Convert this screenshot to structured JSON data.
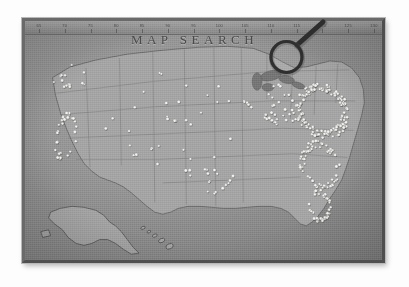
{
  "page": {
    "background_color": "#fdfdfd"
  },
  "map": {
    "title": "MAP SEARCH",
    "frame_color": "#6a6a6a",
    "paper_color": "#9a9a9a",
    "land_color": "#a2a2a2",
    "pin_color": "#f2f2ef",
    "subject": "united-states-map",
    "ruler_ticks": [
      "65",
      "70",
      "75",
      "80",
      "85",
      "90",
      "95",
      "100",
      "105",
      "110",
      "115",
      "120",
      "125",
      "130"
    ]
  },
  "magnifier": {
    "label": "magnifying-glass",
    "lens_color": "#3a3a3a",
    "handle_color": "#2e2e2e"
  },
  "insets": [
    {
      "name": "alaska"
    },
    {
      "name": "hawaii"
    }
  ],
  "chart_data": {
    "type": "scatter",
    "title": "MAP SEARCH",
    "xlabel": "",
    "ylabel": "",
    "legend_position": "none",
    "grid": false,
    "regions": [
      {
        "name": "northeast-atlantic-corridor",
        "pin_count": 420,
        "density": "very-high"
      },
      {
        "name": "southeast-atlantic-coast",
        "pin_count": 180,
        "density": "high"
      },
      {
        "name": "florida-coastline",
        "pin_count": 95,
        "density": "high"
      },
      {
        "name": "great-lakes-midwest",
        "pin_count": 110,
        "density": "medium"
      },
      {
        "name": "california-coast",
        "pin_count": 85,
        "density": "high"
      },
      {
        "name": "pacific-northwest",
        "pin_count": 40,
        "density": "medium"
      },
      {
        "name": "texas-south-central",
        "pin_count": 55,
        "density": "medium"
      },
      {
        "name": "great-plains-mountain-west",
        "pin_count": 90,
        "density": "low"
      }
    ]
  }
}
